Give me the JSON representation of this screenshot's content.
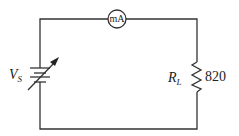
{
  "diagram": {
    "type": "circuit",
    "components": {
      "source": {
        "symbol": "V",
        "subscript": "S",
        "kind": "variable-dc-source"
      },
      "ammeter": {
        "label": "mA"
      },
      "load": {
        "symbol": "R",
        "subscript": "L",
        "value": "820"
      }
    }
  }
}
